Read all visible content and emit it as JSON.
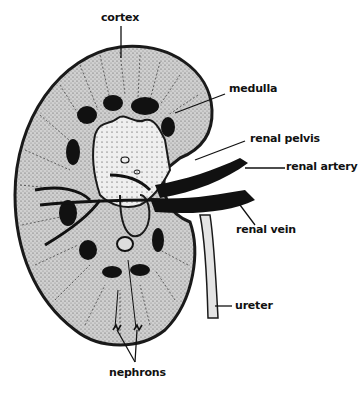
{
  "diagram": {
    "colors": {
      "outline": "#1a1a1a",
      "cortex_fill": "#c9c9c9",
      "pelvis_fill": "#e6e6e6",
      "vessel": "#111111",
      "background": "#ffffff"
    },
    "labels": {
      "cortex": "cortex",
      "medulla": "medulla",
      "renal_pelvis": "renal pelvis",
      "renal_artery": "renal artery",
      "renal_vein": "renal vein",
      "ureter": "ureter",
      "nephrons": "nephrons"
    }
  }
}
